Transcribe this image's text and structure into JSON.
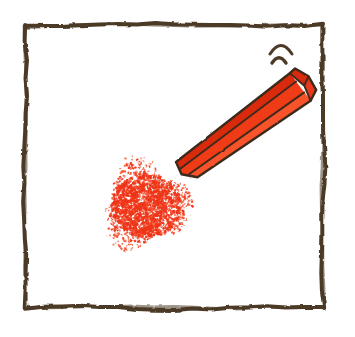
{
  "scene": {
    "title": "Red crayon with scribbled patch",
    "description": "Hand-drawn illustration inside a rough brown square frame: a red hexagonal crayon angled from lower-left to upper-right, a stippled red scribble patch below-left of the crayon tip, and two small curved motion arcs near the crayon's top end.",
    "background_color": "#ffffff",
    "width": 355,
    "height": 337
  },
  "frame": {
    "name": "hand-drawn square border",
    "stroke_color": "#4c3a27",
    "stroke_width": 4,
    "left": 25,
    "top": 25,
    "right": 323,
    "bottom": 308
  },
  "crayon": {
    "name": "red crayon",
    "body_color": "#ef3a17",
    "body_color_light": "#f8522c",
    "body_color_dark": "#d92c0a",
    "end_face_color": "#e8391a",
    "outline_color": "#3d2b1c",
    "outline_width": 2.4,
    "angle_degrees": -38,
    "tip_x": 186,
    "tip_y": 172,
    "cap_x": 303,
    "cap_y": 84
  },
  "arcs": {
    "name": "motion arcs",
    "stroke_color": "#4c3a27",
    "count": 2,
    "upper": {
      "cx": 281,
      "cy": 54,
      "rx": 11,
      "ry": 8
    },
    "lower": {
      "cx": 279,
      "cy": 63,
      "rx": 7,
      "ry": 5
    }
  },
  "scribble": {
    "name": "red stippled scribble patch",
    "color": "#ef3417",
    "color_light": "#f75a34",
    "center_x": 146,
    "center_y": 206,
    "radius_x": 47,
    "radius_y": 42,
    "dot_count": 1750,
    "seed": 20240517
  }
}
